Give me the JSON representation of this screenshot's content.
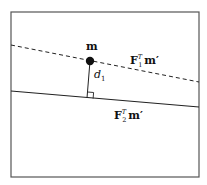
{
  "diagram": {
    "point_label": "m",
    "distance_label": "d",
    "distance_subscript": "1",
    "line1": {
      "label_main": "F",
      "label_sup": "T",
      "label_sub": "1",
      "label_tail": "m′",
      "style": "dashed"
    },
    "line2": {
      "label_main": "F",
      "label_sup": "T",
      "label_sub": "2",
      "label_tail": "m′",
      "style": "solid"
    },
    "colors": {
      "stroke": "#222222",
      "frame": "#555555",
      "point": "#111111"
    }
  }
}
